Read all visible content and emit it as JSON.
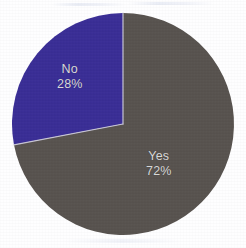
{
  "figure": {
    "background_color": "#fefeff",
    "label_text_color": "#d9d9d9"
  },
  "pie": {
    "center_x": 123,
    "center_y": 124,
    "radius": 111,
    "start_angle_deg": 0,
    "direction": "clockwise",
    "seam_color": "#c8c6d4"
  },
  "chart_data": {
    "type": "pie",
    "title": "",
    "subtitle": "",
    "xlabel": "",
    "ylabel": "",
    "grid": false,
    "legend_position": "none",
    "labels_inside_slices": true,
    "categories": [
      "Yes",
      "No"
    ],
    "values": [
      72,
      28
    ],
    "units": "percent",
    "slices": [
      {
        "name": "Yes",
        "label": "Yes",
        "value": 72,
        "value_label": "72%",
        "color": "#58534f",
        "start_angle_deg": 0,
        "sweep_deg": 259.2,
        "label_x": 146,
        "label_y": 149
      },
      {
        "name": "No",
        "label": "No",
        "value": 28,
        "value_label": "28%",
        "color": "#3a2e96",
        "start_angle_deg": 259.2,
        "sweep_deg": 100.8,
        "label_x": 57,
        "label_y": 62
      }
    ],
    "annotations": []
  }
}
